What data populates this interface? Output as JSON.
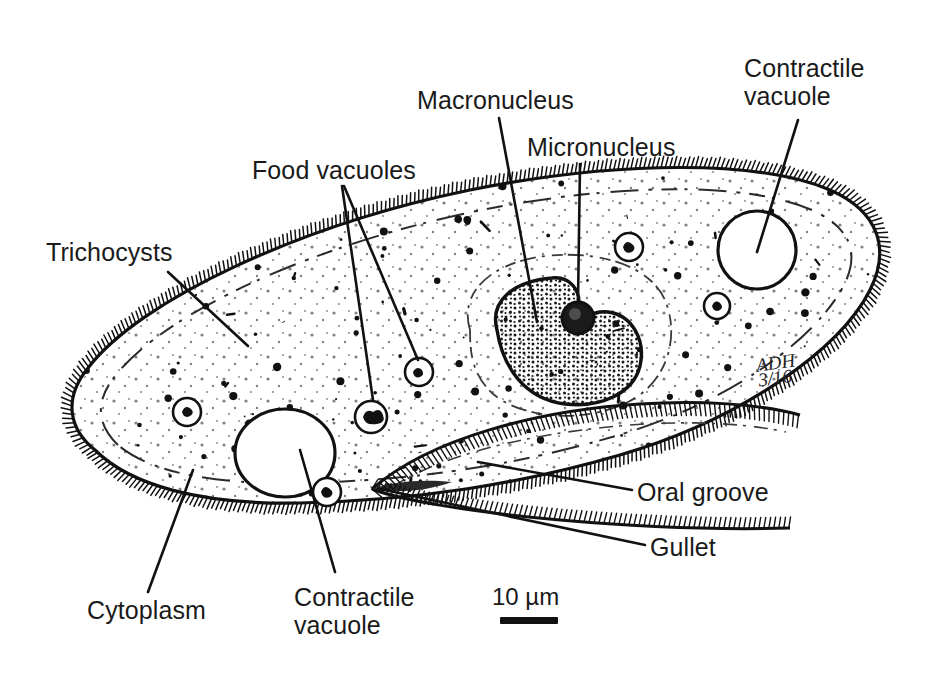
{
  "figure": {
    "background_color": "#ffffff",
    "ink_color": "#111111"
  },
  "labels": [
    {
      "id": "trichocysts",
      "text": "Trichocysts",
      "x": 46,
      "y": 238
    },
    {
      "id": "food-vacuoles",
      "text": "Food vacuoles",
      "x": 252,
      "y": 156
    },
    {
      "id": "macronucleus",
      "text": "Macronucleus",
      "x": 417,
      "y": 86
    },
    {
      "id": "micronucleus",
      "text": "Micronucleus",
      "x": 527,
      "y": 133
    },
    {
      "id": "contractile-vacuole-top",
      "text": "Contractile\nvacuole",
      "x": 744,
      "y": 54
    },
    {
      "id": "oral-groove",
      "text": "Oral groove",
      "x": 637,
      "y": 478
    },
    {
      "id": "gullet",
      "text": "Gullet",
      "x": 650,
      "y": 533
    },
    {
      "id": "cytoplasm",
      "text": "Cytoplasm",
      "x": 87,
      "y": 596
    },
    {
      "id": "contractile-vacuole-bottom",
      "text": "Contractile\nvacuole",
      "x": 294,
      "y": 583
    }
  ],
  "scale": {
    "value": "10 µm",
    "x": 492,
    "y": 583,
    "bar_x": 500,
    "bar_y": 617,
    "bar_width": 58,
    "bar_height": 7
  },
  "signature": {
    "initials": "ADH",
    "date": "3/16",
    "x": 757,
    "y": 355
  },
  "chart_data": {
    "type": "diagram",
    "structures": [
      "Trichocysts",
      "Food vacuoles",
      "Macronucleus",
      "Micronucleus",
      "Contractile vacuole",
      "Oral groove",
      "Gullet",
      "Cytoplasm",
      "Cilia"
    ],
    "scale_bar": "10 µm"
  }
}
